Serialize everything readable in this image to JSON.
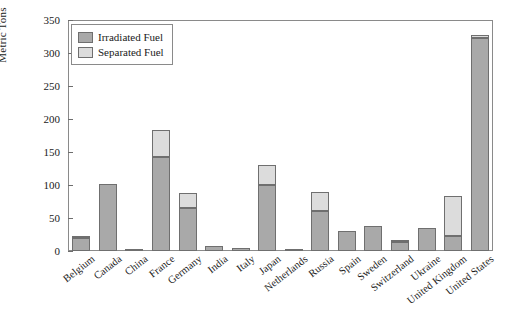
{
  "chart_data": {
    "type": "bar",
    "subtype": "stacked",
    "title": "",
    "xlabel": "",
    "ylabel": "Metric Tons",
    "ylim": [
      0,
      350
    ],
    "ytick_step": 50,
    "yticks": [
      "0",
      "50",
      "100",
      "150",
      "200",
      "250",
      "300",
      "350"
    ],
    "grid": false,
    "legend_position": "upper-left-inside",
    "categories": [
      "Belgium",
      "Canada",
      "China",
      "France",
      "Germany",
      "India",
      "Italy",
      "Japan",
      "Netherlands",
      "Russia",
      "Spain",
      "Sweden",
      "Switzerland",
      "Ukraine",
      "United Kingdom",
      "United States"
    ],
    "series": [
      {
        "name": "Irradiated Fuel",
        "color": "#a9a9a9",
        "values": [
          20,
          102,
          1.5,
          143,
          65,
          8,
          5,
          100,
          2,
          60,
          30,
          38,
          13,
          35,
          22,
          322
        ]
      },
      {
        "name": "Separated Fuel",
        "color": "#dcdcdc",
        "values": [
          3,
          0,
          0,
          40,
          23,
          0,
          0,
          30,
          0,
          30,
          0,
          0,
          4,
          0,
          61,
          5
        ]
      }
    ],
    "totals": [
      23,
      102,
      1.5,
      183,
      88,
      8,
      5,
      130,
      2,
      90,
      30,
      38,
      17,
      35,
      83,
      327
    ]
  },
  "legend": {
    "items": [
      {
        "label": "Irradiated Fuel",
        "swatch": "irr"
      },
      {
        "label": "Separated Fuel",
        "swatch": "sep"
      }
    ]
  },
  "colors": {
    "irradiated": "#a9a9a9",
    "separated": "#dcdcdc",
    "axis": "#8a8a8a",
    "text": "#1a1a1a",
    "background": "#ffffff"
  }
}
